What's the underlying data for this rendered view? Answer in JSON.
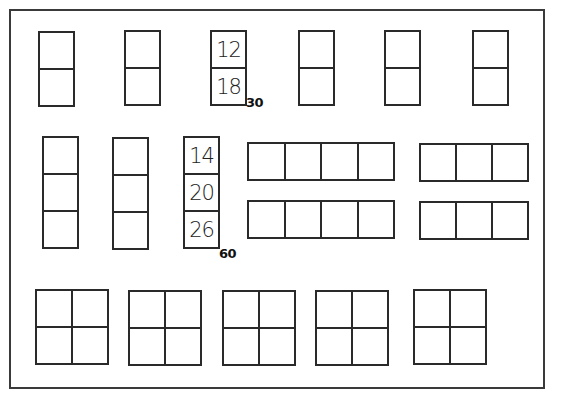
{
  "diagram": {
    "type": "array-grid-layout",
    "frame": {
      "left": 9,
      "top": 9,
      "width": 538,
      "height": 382
    },
    "groups": [
      {
        "id": "r1g1",
        "x": 38,
        "y": 31,
        "cols": 1,
        "rows": 2,
        "cw": 35,
        "ch": 37,
        "cells": []
      },
      {
        "id": "r1g2",
        "x": 124,
        "y": 30,
        "cols": 1,
        "rows": 2,
        "cw": 35,
        "ch": 37,
        "cells": []
      },
      {
        "id": "r1g3",
        "x": 210,
        "y": 30,
        "cols": 1,
        "rows": 2,
        "cw": 35,
        "ch": 37,
        "cells": [
          "12",
          "18"
        ],
        "total": "30",
        "total_x": 246,
        "total_y": 95
      },
      {
        "id": "r1g4",
        "x": 298,
        "y": 30,
        "cols": 1,
        "rows": 2,
        "cw": 35,
        "ch": 37,
        "cells": []
      },
      {
        "id": "r1g5",
        "x": 384,
        "y": 30,
        "cols": 1,
        "rows": 2,
        "cw": 35,
        "ch": 37,
        "cells": []
      },
      {
        "id": "r1g6",
        "x": 472,
        "y": 30,
        "cols": 1,
        "rows": 2,
        "cw": 35,
        "ch": 37,
        "cells": []
      },
      {
        "id": "r2g1",
        "x": 42,
        "y": 136,
        "cols": 1,
        "rows": 3,
        "cw": 35,
        "ch": 37,
        "cells": []
      },
      {
        "id": "r2g2",
        "x": 112,
        "y": 137,
        "cols": 1,
        "rows": 3,
        "cw": 35,
        "ch": 37,
        "cells": []
      },
      {
        "id": "r2g3",
        "x": 183,
        "y": 136,
        "cols": 1,
        "rows": 3,
        "cw": 35,
        "ch": 37,
        "cells": [
          "14",
          "20",
          "26"
        ],
        "total": "60",
        "total_x": 219,
        "total_y": 246
      },
      {
        "id": "r2g4",
        "x": 247,
        "y": 142,
        "cols": 4,
        "rows": 1,
        "cw": 36.5,
        "ch": 37,
        "cells": []
      },
      {
        "id": "r2g5",
        "x": 419,
        "y": 143,
        "cols": 3,
        "rows": 1,
        "cw": 36,
        "ch": 37,
        "cells": []
      },
      {
        "id": "r2g6",
        "x": 247,
        "y": 200,
        "cols": 4,
        "rows": 1,
        "cw": 36.5,
        "ch": 37,
        "cells": []
      },
      {
        "id": "r2g7",
        "x": 419,
        "y": 201,
        "cols": 3,
        "rows": 1,
        "cw": 36,
        "ch": 37,
        "cells": []
      },
      {
        "id": "r3g1",
        "x": 35,
        "y": 289,
        "cols": 2,
        "rows": 2,
        "cw": 36,
        "ch": 37,
        "cells": []
      },
      {
        "id": "r3g2",
        "x": 128,
        "y": 290,
        "cols": 2,
        "rows": 2,
        "cw": 36,
        "ch": 37,
        "cells": []
      },
      {
        "id": "r3g3",
        "x": 222,
        "y": 290,
        "cols": 2,
        "rows": 2,
        "cw": 36,
        "ch": 37,
        "cells": []
      },
      {
        "id": "r3g4",
        "x": 315,
        "y": 290,
        "cols": 2,
        "rows": 2,
        "cw": 36,
        "ch": 37,
        "cells": []
      },
      {
        "id": "r3g5",
        "x": 413,
        "y": 289,
        "cols": 2,
        "rows": 2,
        "cw": 36,
        "ch": 37,
        "cells": []
      }
    ],
    "labels": {
      "group_a_values": [
        "12",
        "18"
      ],
      "group_a_total": "30",
      "group_b_values": [
        "14",
        "20",
        "26"
      ],
      "group_b_total": "60"
    },
    "colors": {
      "line": "#2a2a2a",
      "background": "#ffffff",
      "text": "#222222"
    }
  }
}
